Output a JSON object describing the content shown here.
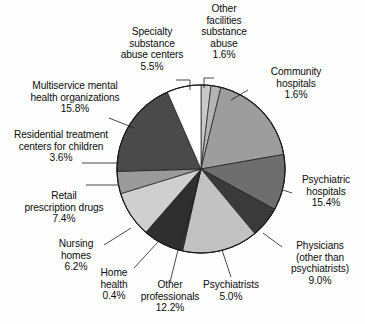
{
  "chart_data": {
    "type": "pie",
    "title": "",
    "subtitle": "",
    "xlabel": "",
    "ylabel": "",
    "legend_position": "labels-with-leader-lines",
    "grid": false,
    "value_unit": "percent",
    "total_shown": 83.7,
    "categories": [
      "Other facilities substance abuse",
      "Community hospitals",
      "Psychiatric hospitals",
      "Physicians (other than psychiatrists)",
      "Psychiatrists",
      "Other professionals",
      "Home health",
      "Nursing homes",
      "Retail prescription drugs",
      "Residential treatment centers for children",
      "Multiservice mental health organizations",
      "Specialty substance abuse centers"
    ],
    "values": [
      1.6,
      1.6,
      15.4,
      9.0,
      5.0,
      12.2,
      0.4,
      6.2,
      7.4,
      3.6,
      15.8,
      5.5
    ],
    "slice_colors": [
      "#c9c9c9",
      "#b4b4b4",
      "#9d9d9d",
      "#6e6e6e",
      "#3a3a3a",
      "#c2c2c2",
      "#3a3a3a",
      "#2f2f2f",
      "#cfcfcf",
      "#9a9a9a",
      "#4a4a4a",
      "#ffffff"
    ],
    "slices": [
      {
        "label": "Other facilities substance abuse",
        "value": 1.6,
        "pct_text": "1.6%",
        "color": "#c9c9c9"
      },
      {
        "label": "Community hospitals",
        "value": 1.6,
        "pct_text": "1.6%",
        "color": "#b4b4b4"
      },
      {
        "label": "Psychiatric hospitals",
        "value": 15.4,
        "pct_text": "15.4%",
        "color": "#9d9d9d"
      },
      {
        "label": "Physicians (other than psychiatrists)",
        "value": 9.0,
        "pct_text": "9.0%",
        "color": "#6e6e6e"
      },
      {
        "label": "Psychiatrists",
        "value": 5.0,
        "pct_text": "5.0%",
        "color": "#3a3a3a"
      },
      {
        "label": "Other professionals",
        "value": 12.2,
        "pct_text": "12.2%",
        "color": "#c2c2c2"
      },
      {
        "label": "Home health",
        "value": 0.4,
        "pct_text": "0.4%",
        "color": "#3a3a3a"
      },
      {
        "label": "Nursing homes",
        "value": 6.2,
        "pct_text": "6.2%",
        "color": "#2f2f2f"
      },
      {
        "label": "Retail prescription drugs",
        "value": 7.4,
        "pct_text": "7.4%",
        "color": "#cfcfcf"
      },
      {
        "label": "Residential treatment centers for children",
        "value": 3.6,
        "pct_text": "3.6%",
        "color": "#9a9a9a"
      },
      {
        "label": "Multiservice mental health organizations",
        "value": 15.8,
        "pct_text": "15.8%",
        "color": "#4a4a4a"
      },
      {
        "label": "Specialty substance abuse centers",
        "value": 5.5,
        "pct_text": "5.5%",
        "color": "#ffffff"
      }
    ]
  },
  "labels": {
    "other_facilities": {
      "l1": "Other",
      "l2": "facilities",
      "l3": "substance",
      "l4": "abuse",
      "pct": "1.6%"
    },
    "community_hospitals": {
      "l1": "Community",
      "l2": "hospitals",
      "pct": "1.6%"
    },
    "psychiatric_hospitals": {
      "l1": "Psychiatric",
      "l2": "hospitals",
      "pct": "15.4%"
    },
    "physicians": {
      "l1": "Physicians",
      "l2": "(other than",
      "l3": "psychiatrists)",
      "pct": "9.0%"
    },
    "psychiatrists": {
      "l1": "Psychiatrists",
      "pct": "5.0%"
    },
    "other_professionals": {
      "l1": "Other",
      "l2": "professionals",
      "pct": "12.2%"
    },
    "home_health": {
      "l1": "Home",
      "l2": "health",
      "pct": "0.4%"
    },
    "nursing_homes": {
      "l1": "Nursing",
      "l2": "homes",
      "pct": "6.2%"
    },
    "retail_drugs": {
      "l1": "Retail",
      "l2": "prescription drugs",
      "pct": "7.4%"
    },
    "residential_treatment": {
      "l1": "Residential treatment",
      "l2": "centers for children",
      "pct": "3.6%"
    },
    "multiservice": {
      "l1": "Multiservice mental",
      "l2": "health organizations",
      "pct": "15.8%"
    },
    "specialty_substance": {
      "l1": "Specialty",
      "l2": "substance",
      "l3": "abuse centers",
      "pct": "5.5%"
    }
  },
  "style": {
    "background": "#fefefe",
    "outline": "#1a1a1a",
    "text": "#0d0d0d"
  }
}
